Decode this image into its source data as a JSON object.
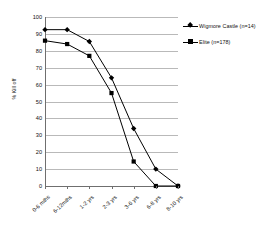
{
  "chart_data": {
    "type": "line",
    "title": "",
    "xlabel": "",
    "ylabel": "% Kill off",
    "ylim": [
      0,
      100
    ],
    "ytick_step": 10,
    "grid": true,
    "legend_position": "top-right",
    "categories": [
      "0-6 mths",
      "6-12mths",
      "1-2 yrs",
      "2-3 yrs",
      "3-6 yrs",
      "6-8 yrs",
      "8-10 yrs"
    ],
    "yticks": [
      "0",
      "10",
      "20",
      "30",
      "40",
      "50",
      "60",
      "70",
      "80",
      "90",
      "100"
    ],
    "series": [
      {
        "name": "Wigmore Castle (n=14)",
        "marker": "diamond",
        "color": "#000000",
        "values": [
          92.5,
          92.5,
          85.5,
          64,
          34,
          10,
          0
        ]
      },
      {
        "name": "Elite (n=178)",
        "marker": "square",
        "color": "#000000",
        "values": [
          86,
          84,
          77,
          55,
          14.5,
          0,
          0
        ]
      }
    ]
  },
  "legend": {
    "entries": [
      {
        "label": "Wigmore Castle (n=14)",
        "marker": "diamond"
      },
      {
        "label": "Elite (n=178)",
        "marker": "square"
      }
    ]
  },
  "axes": {
    "y_title": "% Kill off"
  }
}
